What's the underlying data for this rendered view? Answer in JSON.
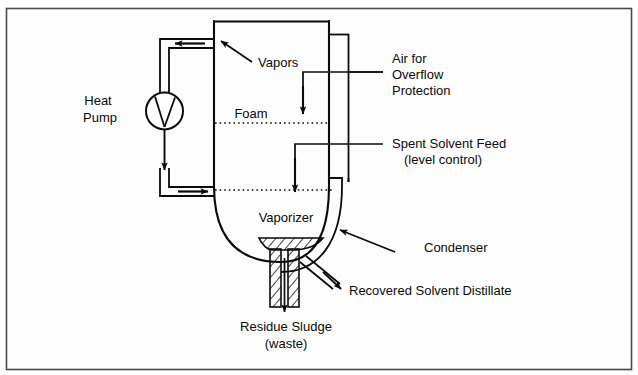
{
  "diagram": {
    "type": "process-flow-diagram",
    "border_color": "#4a4a4a",
    "line_color": "#0a0a0a",
    "background": "#fdfdfd",
    "labels": {
      "heat_pump_line1": "Heat",
      "heat_pump_line2": "Pump",
      "vapors": "Vapors",
      "foam": "Foam",
      "air_line1": "Air for",
      "air_line2": "Overflow",
      "air_line3": "Protection",
      "feed_line1": "Spent Solvent Feed",
      "feed_line2": "(level control)",
      "vaporizer": "Vaporizer",
      "condenser": "Condenser",
      "distillate": "Recovered Solvent Distillate",
      "residue_line1": "Residue Sludge",
      "residue_line2": "(waste)"
    }
  }
}
